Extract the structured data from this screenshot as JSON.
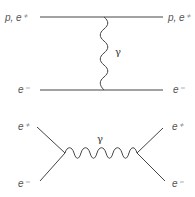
{
  "diagrams": [
    {
      "name": "t-channel scattering",
      "incoming_top": "p, e⁺",
      "outgoing_top": "p, e⁺",
      "incoming_bottom": "e⁻",
      "outgoing_bottom": "e⁻",
      "exchange": "γ"
    },
    {
      "name": "s-channel annihilation",
      "incoming_top": "e⁺",
      "incoming_bottom": "e⁻",
      "outgoing_top": "e⁺",
      "outgoing_bottom": "e⁻",
      "propagator": "γ"
    }
  ],
  "colors": {
    "line": "#444444",
    "label": "#555555"
  }
}
